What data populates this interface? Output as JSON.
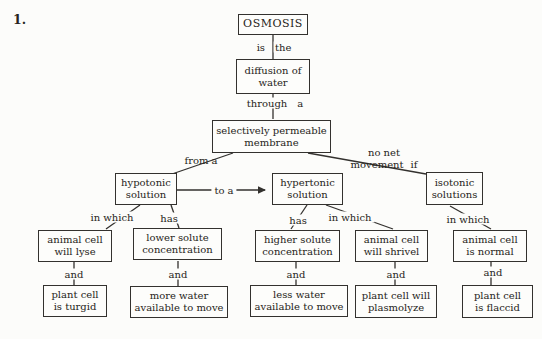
{
  "page": {
    "question_number": "1."
  },
  "colors": {
    "paper": "#fcfcfa",
    "ink": "#33312e"
  },
  "nodes": {
    "osmosis": {
      "text": "OSMOSIS"
    },
    "diffusion": {
      "text": "diffusion of\nwater"
    },
    "membrane": {
      "text": "selectively permeable\nmembrane"
    },
    "hypotonic": {
      "text": "hypotonic\nsolution"
    },
    "hypertonic": {
      "text": "hypertonic\nsolution"
    },
    "isotonic": {
      "text": "isotonic\nsolutions"
    },
    "animal_lyse": {
      "text": "animal cell\nwill lyse"
    },
    "lower_solute": {
      "text": "lower solute\nconcentration"
    },
    "higher_solute": {
      "text": "higher solute\nconcentration"
    },
    "animal_shrivel": {
      "text": "animal cell\nwill shrivel"
    },
    "animal_normal": {
      "text": "animal cell\nis normal"
    },
    "plant_turgid": {
      "text": "plant cell\nis turgid"
    },
    "more_water": {
      "text": "more water\navailable to move"
    },
    "less_water": {
      "text": "less water\navailable to move"
    },
    "plant_plasmolyze": {
      "text": "plant cell will\nplasmolyze"
    },
    "plant_flaccid": {
      "text": "plant cell\nis flaccid"
    }
  },
  "labels": {
    "is": "is",
    "the": "the",
    "through": "through",
    "a": "a",
    "from_a": "from a",
    "no_net": "no net",
    "movement": "movement",
    "if": "if",
    "to_a": "to a",
    "in_which": "in which",
    "has": "has",
    "and": "and"
  },
  "edges": [
    {
      "from": "osmosis",
      "label": "is the",
      "to": "diffusion"
    },
    {
      "from": "diffusion",
      "label": "through a",
      "to": "membrane"
    },
    {
      "from": "membrane",
      "label": "from a",
      "to": "hypotonic"
    },
    {
      "from": "hypotonic",
      "label": "to a",
      "to": "hypertonic",
      "arrow": true
    },
    {
      "from": "membrane",
      "label": "no net movement if",
      "to": "isotonic"
    },
    {
      "from": "hypotonic",
      "label": "in which",
      "to": "animal_lyse"
    },
    {
      "from": "hypotonic",
      "label": "has",
      "to": "lower_solute"
    },
    {
      "from": "hypertonic",
      "label": "has",
      "to": "higher_solute"
    },
    {
      "from": "hypertonic",
      "label": "in which",
      "to": "animal_shrivel"
    },
    {
      "from": "isotonic",
      "label": "in which",
      "to": "animal_normal"
    },
    {
      "from": "animal_lyse",
      "label": "and",
      "to": "plant_turgid"
    },
    {
      "from": "lower_solute",
      "label": "and",
      "to": "more_water"
    },
    {
      "from": "higher_solute",
      "label": "and",
      "to": "less_water"
    },
    {
      "from": "animal_shrivel",
      "label": "and",
      "to": "plant_plasmolyze"
    },
    {
      "from": "animal_normal",
      "label": "and",
      "to": "plant_flaccid"
    }
  ]
}
